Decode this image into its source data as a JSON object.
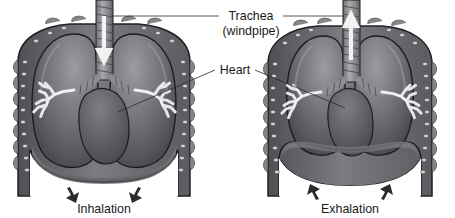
{
  "figure": {
    "title_visible": false,
    "background_color": "#ffffff",
    "style": "grayscale medical illustration",
    "panels": [
      {
        "id": "left-panel",
        "phase_label": "Inhalation",
        "diaphragm_state": "flattened-lowered",
        "airflow_direction": "down",
        "lung_state": "expanded",
        "name": "inhalation-figure"
      },
      {
        "id": "right-panel",
        "phase_label": "Exhalation",
        "diaphragm_state": "domed-raised",
        "airflow_direction": "up",
        "lung_state": "contracted",
        "name": "exhalation-figure"
      }
    ]
  },
  "labels": {
    "trachea_line1": "Trachea",
    "trachea_line2": "(windpipe)",
    "heart": "Heart",
    "inhalation": "Inhalation",
    "exhalation": "Exhalation"
  },
  "colors": {
    "background": "#ffffff",
    "chest_wall": "#6f7174",
    "chest_wall_dark": "#4a4c4f",
    "rib_marker": "#cfd1d2",
    "lung_light": "#8e9093",
    "lung_mid": "#6a6c70",
    "lung_dark": "#3f4145",
    "heart": "#5d5f63",
    "trachea": "#97999c",
    "bronchi": "#e2e3e4",
    "outline": "#1f2124",
    "arrow": "#2a2c2f",
    "text": "#1a1a1a",
    "airflow_arrow": "#f2f2f2"
  },
  "anatomy": {
    "parts": [
      "trachea",
      "windpipe-cartilage-rings",
      "left-lung",
      "right-lung",
      "heart",
      "bronchial-tree",
      "rib-cage",
      "diaphragm"
    ]
  }
}
